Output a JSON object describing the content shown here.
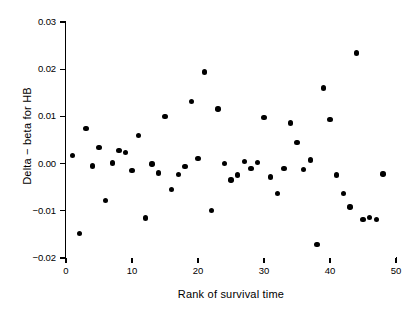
{
  "chart_data": {
    "type": "scatter",
    "title": "",
    "xlabel": "Rank of survival time",
    "ylabel": "Delta − beta for HB",
    "xlim": [
      0,
      50
    ],
    "ylim": [
      -0.02,
      0.03
    ],
    "grid": false,
    "legend": null,
    "xticks": [
      0,
      10,
      20,
      30,
      40,
      50
    ],
    "xtick_labels": [
      "0",
      "10",
      "20",
      "30",
      "40",
      "50"
    ],
    "yticks": [
      0.03,
      0.02,
      0.01,
      0.0,
      -0.01,
      -0.02
    ],
    "ytick_labels": [
      "0.03",
      "0.02",
      "0.01",
      "0.00",
      "−0.01",
      "−0.02"
    ],
    "marker": "filled-circle",
    "marker_color": "#000000",
    "x": [
      1,
      2,
      3,
      4,
      5,
      6,
      7,
      8,
      9,
      10,
      11,
      12,
      13,
      14,
      15,
      16,
      17,
      18,
      19,
      20,
      21,
      22,
      23,
      24,
      25,
      26,
      27,
      28,
      29,
      30,
      31,
      32,
      33,
      34,
      35,
      36,
      37,
      38,
      39,
      40,
      41,
      42,
      43,
      44,
      45,
      46,
      47,
      48
    ],
    "y": [
      0.0017,
      -0.0148,
      0.0074,
      -0.0005,
      0.0034,
      -0.0078,
      0.0001,
      0.0028,
      0.0023,
      -0.0014,
      0.0059,
      -0.0115,
      -0.0001,
      -0.002,
      0.01,
      -0.0055,
      -0.0023,
      -0.0006,
      0.0131,
      0.0011,
      0.0194,
      -0.0099,
      0.0116,
      -0.0,
      -0.0035,
      -0.0024,
      0.0005,
      -0.001,
      0.0002,
      0.0098,
      -0.0028,
      -0.0063,
      -0.001,
      0.0086,
      0.0045,
      -0.0012,
      0.0008,
      -0.0172,
      0.016,
      0.0094,
      -0.0024,
      -0.0063,
      -0.0092,
      0.0234,
      -0.0118,
      -0.0114,
      -0.0119,
      -0.0022
    ],
    "series": [
      {
        "name": "Delta-beta for HB",
        "points": [
          [
            1,
            0.0017
          ],
          [
            2,
            -0.0148
          ],
          [
            3,
            0.0074
          ],
          [
            4,
            -0.0005
          ],
          [
            5,
            0.0034
          ],
          [
            6,
            -0.0078
          ],
          [
            7,
            0.0001
          ],
          [
            8,
            0.0028
          ],
          [
            9,
            0.0023
          ],
          [
            10,
            -0.0014
          ],
          [
            11,
            0.0059
          ],
          [
            12,
            -0.0115
          ],
          [
            13,
            -0.0001
          ],
          [
            14,
            -0.002
          ],
          [
            15,
            0.01
          ],
          [
            16,
            -0.0055
          ],
          [
            17,
            -0.0023
          ],
          [
            18,
            -0.0006
          ],
          [
            19,
            0.0131
          ],
          [
            20,
            0.0011
          ],
          [
            21,
            0.0194
          ],
          [
            22,
            -0.0099
          ],
          [
            23,
            0.0116
          ],
          [
            24,
            -0.0
          ],
          [
            25,
            -0.0035
          ],
          [
            26,
            -0.0024
          ],
          [
            27,
            0.0005
          ],
          [
            28,
            -0.001
          ],
          [
            29,
            0.0002
          ],
          [
            30,
            0.0098
          ],
          [
            31,
            -0.0028
          ],
          [
            32,
            -0.0063
          ],
          [
            33,
            -0.001
          ],
          [
            34,
            0.0086
          ],
          [
            35,
            0.0045
          ],
          [
            36,
            -0.0012
          ],
          [
            37,
            0.0008
          ],
          [
            38,
            -0.0172
          ],
          [
            39,
            0.016
          ],
          [
            40,
            0.0094
          ],
          [
            41,
            -0.0024
          ],
          [
            42,
            -0.0063
          ],
          [
            43,
            -0.0092
          ],
          [
            44,
            0.0234
          ],
          [
            45,
            -0.0118
          ],
          [
            46,
            -0.0114
          ],
          [
            47,
            -0.0119
          ],
          [
            48,
            -0.0022
          ]
        ]
      }
    ],
    "n_points": 48
  },
  "axes": {
    "x_title": "Rank of survival time",
    "y_title": "Delta − beta for HB"
  }
}
